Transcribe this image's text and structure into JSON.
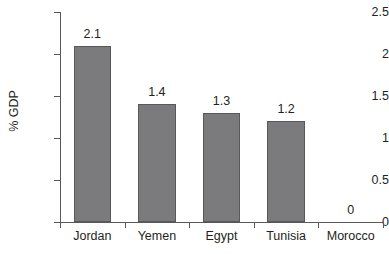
{
  "chart_data": {
    "type": "bar",
    "title": "",
    "xlabel": "",
    "ylabel": "% GDP",
    "categories": [
      "Jordan",
      "Yemen",
      "Egypt",
      "Tunisia",
      "Morocco"
    ],
    "values": [
      2.1,
      1.4,
      1.3,
      1.2,
      0
    ],
    "value_labels": [
      "2.1",
      "1.4",
      "1.3",
      "1.2",
      "0"
    ],
    "ylim": [
      0,
      2.5
    ],
    "ytick_values": [
      0,
      0.5,
      1,
      1.5,
      2,
      2.5
    ],
    "ytick_labels": [
      "0",
      "0.5",
      "1",
      "1.5",
      "2",
      "2.5"
    ],
    "grid": false,
    "legend": null,
    "legend_position": "none",
    "series": [
      {
        "name": "% GDP",
        "values": [
          2.1,
          1.4,
          1.3,
          1.2,
          0
        ]
      }
    ],
    "colors": {
      "bar_fill": "#7b7b7d",
      "bar_stroke": "#58585a",
      "axis": "#58585a",
      "text": "#231f20",
      "background": "#ffffff"
    }
  }
}
